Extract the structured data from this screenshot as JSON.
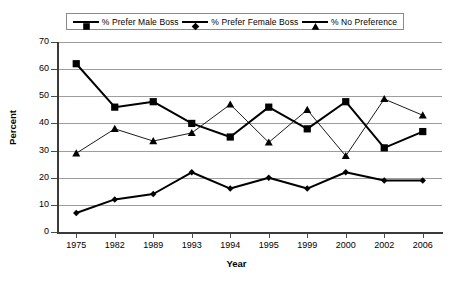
{
  "chart_data": {
    "type": "line",
    "title": "",
    "xlabel": "Year",
    "ylabel": "Percent",
    "categories": [
      "1975",
      "1982",
      "1989",
      "1993",
      "1994",
      "1995",
      "1999",
      "2000",
      "2002",
      "2006"
    ],
    "ylim": [
      0,
      70
    ],
    "ytick_step": 10,
    "yticks": [
      "0",
      "10",
      "20",
      "30",
      "40",
      "50",
      "60",
      "70"
    ],
    "grid": true,
    "legend_position": "top-center",
    "series": [
      {
        "name": "% Prefer Male Boss",
        "marker": "square",
        "color": "#000000",
        "values": [
          62,
          46,
          48,
          40,
          35,
          46,
          38,
          48,
          31,
          37
        ]
      },
      {
        "name": "% Prefer Female Boss",
        "marker": "diamond",
        "color": "#000000",
        "values": [
          7,
          12,
          14,
          22,
          16,
          20,
          16,
          22,
          19,
          19
        ]
      },
      {
        "name": "% No Preference",
        "marker": "triangle",
        "color": "#000000",
        "values": [
          29,
          38,
          33.5,
          36.5,
          47,
          33,
          45,
          28,
          49,
          43
        ]
      }
    ]
  },
  "legend": {
    "items": [
      {
        "label": "% Prefer Male Boss",
        "marker": "square-marker-icon"
      },
      {
        "label": "% Prefer Female Boss",
        "marker": "diamond-marker-icon"
      },
      {
        "label": "% No Preference",
        "marker": "triangle-marker-icon"
      }
    ]
  },
  "axes": {
    "y_title": "Percent",
    "x_title": "Year"
  }
}
